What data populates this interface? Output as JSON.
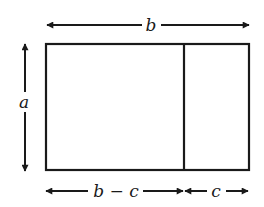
{
  "diagram": {
    "labels": {
      "top_width": "b",
      "left_height": "a",
      "bottom_left_width": "b − c",
      "bottom_right_width": "c"
    },
    "colors": {
      "stroke": "#1a1a1a",
      "background": "#ffffff"
    }
  }
}
